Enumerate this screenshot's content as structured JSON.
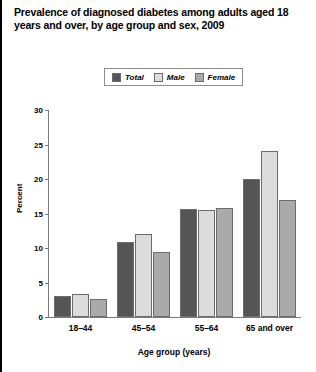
{
  "title": "Prevalence of diagnosed diabetes among adults aged 18 years and over, by age group and sex, 2009",
  "legend": {
    "entries": [
      {
        "label": "Total",
        "color": "#555555"
      },
      {
        "label": "Male",
        "color": "#dcdcdc"
      },
      {
        "label": "Female",
        "color": "#aaaaaa"
      }
    ]
  },
  "axes": {
    "y_title": "Percent",
    "x_title": "Age group (years)",
    "y_ticks": [
      "0",
      "5",
      "10",
      "15",
      "20",
      "25",
      "30"
    ]
  },
  "chart_data": {
    "type": "bar",
    "title": "Prevalence of diagnosed diabetes among adults aged 18 years and over, by age group and sex, 2009",
    "xlabel": "Age group (years)",
    "ylabel": "Percent",
    "ylim": [
      0,
      30
    ],
    "ytick_step": 5,
    "grid": false,
    "legend_position": "top-center",
    "categories": [
      "18–44",
      "45–54",
      "55–64",
      "65 and over"
    ],
    "series": [
      {
        "name": "Total",
        "color": "#555555",
        "values": [
          3.0,
          10.8,
          15.7,
          20.0
        ]
      },
      {
        "name": "Male",
        "color": "#dcdcdc",
        "values": [
          3.4,
          12.0,
          15.5,
          24.0
        ]
      },
      {
        "name": "Female",
        "color": "#aaaaaa",
        "values": [
          2.6,
          9.4,
          15.8,
          16.9
        ]
      }
    ]
  }
}
